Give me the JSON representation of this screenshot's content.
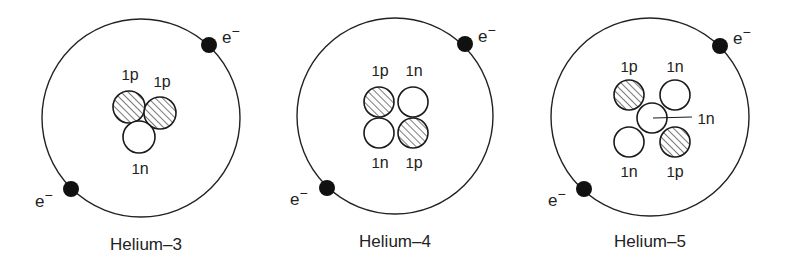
{
  "diagram": {
    "type": "atomic-models",
    "colors": {
      "line": "#222222",
      "electron": "#111111",
      "proton_fill": "hatched",
      "neutron_fill": "#ffffff",
      "background": "#ffffff"
    },
    "atoms": [
      {
        "caption": "Helium–3",
        "orbit": {
          "cx": 141,
          "cy": 118,
          "r": 99
        },
        "electrons": [
          {
            "cx": 209,
            "cy": 45,
            "label": "e",
            "sup": "−",
            "lx": 222,
            "ly": 43
          },
          {
            "cx": 71,
            "cy": 189,
            "label": "e",
            "sup": "−",
            "lx": 35,
            "ly": 207
          }
        ],
        "nucleons": [
          {
            "kind": "proton",
            "cx": 129,
            "cy": 107,
            "r": 16,
            "label": "1p",
            "lx": 130,
            "ly": 80
          },
          {
            "kind": "proton",
            "cx": 160,
            "cy": 113,
            "r": 16,
            "label": "1p",
            "lx": 162,
            "ly": 87
          },
          {
            "kind": "neutron",
            "cx": 139,
            "cy": 137,
            "r": 16,
            "label": "1n",
            "lx": 140,
            "ly": 174
          }
        ],
        "caption_pos": {
          "x": 146,
          "y": 250
        }
      },
      {
        "caption": "Helium–4",
        "orbit": {
          "cx": 395,
          "cy": 116,
          "r": 98
        },
        "electrons": [
          {
            "cx": 465,
            "cy": 44,
            "label": "e",
            "sup": "−",
            "lx": 478,
            "ly": 42
          },
          {
            "cx": 327,
            "cy": 188,
            "label": "e",
            "sup": "−",
            "lx": 290,
            "ly": 205
          }
        ],
        "nucleons": [
          {
            "kind": "proton",
            "cx": 379,
            "cy": 102,
            "r": 15,
            "label": "1p",
            "lx": 380,
            "ly": 76
          },
          {
            "kind": "neutron",
            "cx": 413,
            "cy": 102,
            "r": 15,
            "label": "1n",
            "lx": 414,
            "ly": 76
          },
          {
            "kind": "neutron",
            "cx": 379,
            "cy": 133,
            "r": 15,
            "label": "1n",
            "lx": 380,
            "ly": 168
          },
          {
            "kind": "proton",
            "cx": 413,
            "cy": 133,
            "r": 15,
            "label": "1p",
            "lx": 414,
            "ly": 168
          }
        ],
        "caption_pos": {
          "x": 395,
          "y": 247
        }
      },
      {
        "caption": "Helium–5",
        "orbit": {
          "cx": 650,
          "cy": 117,
          "r": 99
        },
        "electrons": [
          {
            "cx": 720,
            "cy": 46,
            "label": "e",
            "sup": "−",
            "lx": 733,
            "ly": 44
          },
          {
            "cx": 584,
            "cy": 189,
            "label": "e",
            "sup": "−",
            "lx": 548,
            "ly": 206
          }
        ],
        "nucleons": [
          {
            "kind": "proton",
            "cx": 629,
            "cy": 95,
            "r": 15,
            "label": "1p",
            "lx": 629,
            "ly": 72
          },
          {
            "kind": "neutron",
            "cx": 675,
            "cy": 95,
            "r": 15,
            "label": "1n",
            "lx": 675,
            "ly": 72
          },
          {
            "kind": "neutron",
            "cx": 652,
            "cy": 118,
            "r": 15,
            "label": "",
            "lx": 0,
            "ly": 0
          },
          {
            "kind": "neutron",
            "cx": 629,
            "cy": 142,
            "r": 15,
            "label": "1n",
            "lx": 629,
            "ly": 177
          },
          {
            "kind": "proton",
            "cx": 675,
            "cy": 142,
            "r": 15,
            "label": "1p",
            "lx": 675,
            "ly": 177
          }
        ],
        "pointer": {
          "x1": 653,
          "y1": 118,
          "x2": 692,
          "y2": 117,
          "label": "1n",
          "lx": 706,
          "ly": 124
        },
        "caption_pos": {
          "x": 650,
          "y": 247
        }
      }
    ]
  }
}
